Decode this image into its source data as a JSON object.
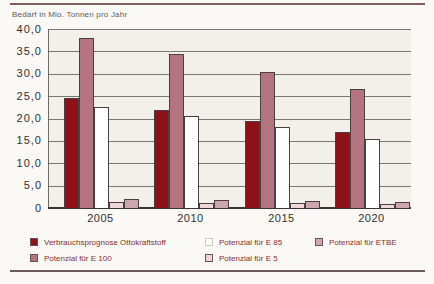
{
  "page": {
    "title": "Bedarf in Mio. Tonnen pro Jahr"
  },
  "chart_data": {
    "type": "bar",
    "title": "Bedarf in Mio. Tonnen pro Jahr",
    "ylabel": "Bedarf in Mio. Tonnen pro Jahr",
    "xlabel": "",
    "categories": [
      "2005",
      "2010",
      "2015",
      "2020"
    ],
    "series": [
      {
        "name": "Verbrauchsprognose Ottokraftstoff",
        "color": "#8e1117",
        "values": [
          24.5,
          22.0,
          19.5,
          17.0
        ]
      },
      {
        "name": "Potenzial für E 100",
        "color": "#b3747f",
        "values": [
          38.0,
          34.5,
          30.5,
          26.5
        ]
      },
      {
        "name": "Potenzial für E 85",
        "color": "#ffffff",
        "values": [
          22.5,
          20.5,
          18.0,
          15.5
        ]
      },
      {
        "name": "Potenzial für E 5",
        "color": "#eed6d9",
        "values": [
          1.4,
          1.2,
          1.1,
          0.8
        ]
      },
      {
        "name": "Potenzial für ETBE",
        "color": "#cda5ae",
        "values": [
          2.0,
          1.7,
          1.6,
          1.3
        ]
      }
    ],
    "ylim": [
      0,
      40
    ],
    "ytick_step": 5,
    "ytick_labels": [
      "40,0",
      "35,0",
      "30,0",
      "25,0",
      "20,0",
      "15,0",
      "10,0",
      "5,0",
      "0"
    ],
    "grid": "horizontal",
    "legend_position": "bottom",
    "colors": {
      "plot_background": "#f3f0ec",
      "page_background": "#fbf9f6",
      "gridline": "#7a7672",
      "axis_text": "#33302e",
      "legend_text": "#852f2d",
      "rule": "#7c5f5b"
    }
  }
}
